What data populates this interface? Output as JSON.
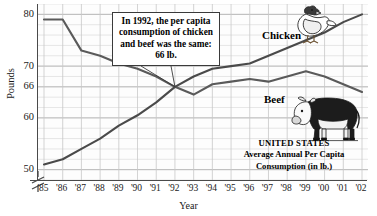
{
  "chart_data": {
    "type": "line",
    "title": "",
    "xlabel": "Year",
    "ylabel": "Pounds",
    "ylim": [
      48,
      82
    ],
    "yticks": [
      50,
      60,
      66,
      70,
      80
    ],
    "y_axis_break": true,
    "grid": true,
    "legend_position": "inline-labels",
    "x": [
      "'85",
      "'86",
      "'87",
      "'88",
      "'89",
      "'90",
      "'91",
      "'92",
      "'93",
      "'94",
      "'95",
      "'96",
      "'97",
      "'98",
      "'99",
      "'00",
      "'01",
      "'02"
    ],
    "series": [
      {
        "name": "Beef",
        "color": "#5a5a5a",
        "values": [
          79,
          79,
          73,
          72,
          70.5,
          69.5,
          68,
          66,
          64.5,
          66.5,
          67,
          67.5,
          67,
          68,
          69,
          68,
          66.5,
          65
        ]
      },
      {
        "name": "Chicken",
        "color": "#4a4a4a",
        "values": [
          51,
          52,
          54,
          56,
          58.5,
          60.5,
          63,
          66,
          68,
          69.5,
          70,
          70.5,
          72,
          73.5,
          75,
          76.5,
          78.5,
          80
        ]
      }
    ],
    "annotations": [
      {
        "name": "crossing-callout",
        "text": "In 1992, the per capita consumption of chicken and beef was the same: 66 lb.",
        "points_to": {
          "x": "'92",
          "y": 66
        }
      }
    ],
    "caption": {
      "line1": "UNITED STATES",
      "line2": "Average Annual Per Capita",
      "line3": "Consumption (in lb.)"
    },
    "series_labels": {
      "chicken": "Chicken",
      "beef": "Beef"
    },
    "icons": {
      "chicken": "chicken-illustration",
      "cow": "cow-illustration"
    }
  }
}
